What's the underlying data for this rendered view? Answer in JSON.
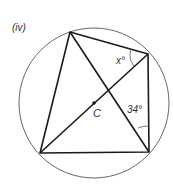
{
  "figure": {
    "label": "(iv)",
    "center_label": "C",
    "angle_x_label": "x°",
    "angle_34_label": "34°"
  },
  "geometry": {
    "circle": {
      "cx": 94,
      "cy": 103,
      "r": 75
    },
    "vertices": {
      "top": [
        70,
        32
      ],
      "top_right": [
        148,
        54
      ],
      "bottom_right": [
        149,
        152
      ],
      "bottom_left": [
        40,
        153
      ]
    },
    "colors": {
      "line": "#1a1a1a",
      "circle": "#555555"
    }
  }
}
